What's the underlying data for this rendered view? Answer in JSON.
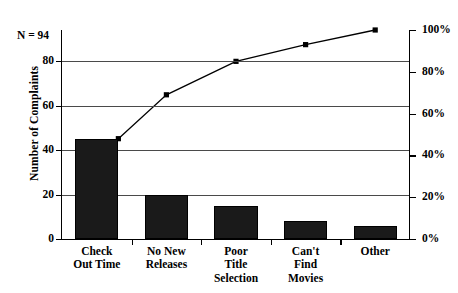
{
  "chart_data": {
    "type": "bar",
    "title": "",
    "subtitle": "",
    "xlabel": "",
    "ylabel": "Number of Complaints",
    "ylabel_right": "",
    "categories": [
      "Check\nOut Time",
      "No New\nReleases",
      "Poor\nTitle\nSelection",
      "Can't\nFind\nMovies",
      "Other"
    ],
    "category_lines": [
      [
        "Check",
        "Out Time"
      ],
      [
        "No New",
        "Releases"
      ],
      [
        "Poor",
        "Title",
        "Selection"
      ],
      [
        "Can't",
        "Find",
        "Movies"
      ],
      [
        "Other"
      ]
    ],
    "values": [
      45,
      20,
      15,
      8,
      6
    ],
    "series": [
      {
        "name": "Number of Complaints",
        "type": "bar",
        "values": [
          45,
          20,
          15,
          8,
          6
        ],
        "color": "#1a1a1a"
      },
      {
        "name": "Cumulative Percentage",
        "type": "line",
        "values": [
          48,
          69,
          85,
          93,
          100
        ],
        "color": "#000000",
        "marker": "square"
      }
    ],
    "ylim": [
      0,
      94
    ],
    "ylim_right": [
      0,
      100
    ],
    "yticks": [
      0,
      20,
      40,
      60,
      80
    ],
    "ytick_labels": [
      "0",
      "20",
      "40",
      "60",
      "80"
    ],
    "yticks_right": [
      0,
      20,
      40,
      60,
      80,
      100
    ],
    "ytick_labels_right": [
      "0%",
      "20%",
      "40%",
      "60%",
      "80%",
      "100%"
    ],
    "grid": true,
    "grid_axis": "y",
    "legend": false,
    "legend_position": "none",
    "annotations": [
      {
        "text": "N = 94",
        "position": "top-left"
      }
    ],
    "total": 94
  },
  "annotation": {
    "n_label": "N = 94"
  },
  "axes": {
    "left_title": "Number of Complaints"
  }
}
